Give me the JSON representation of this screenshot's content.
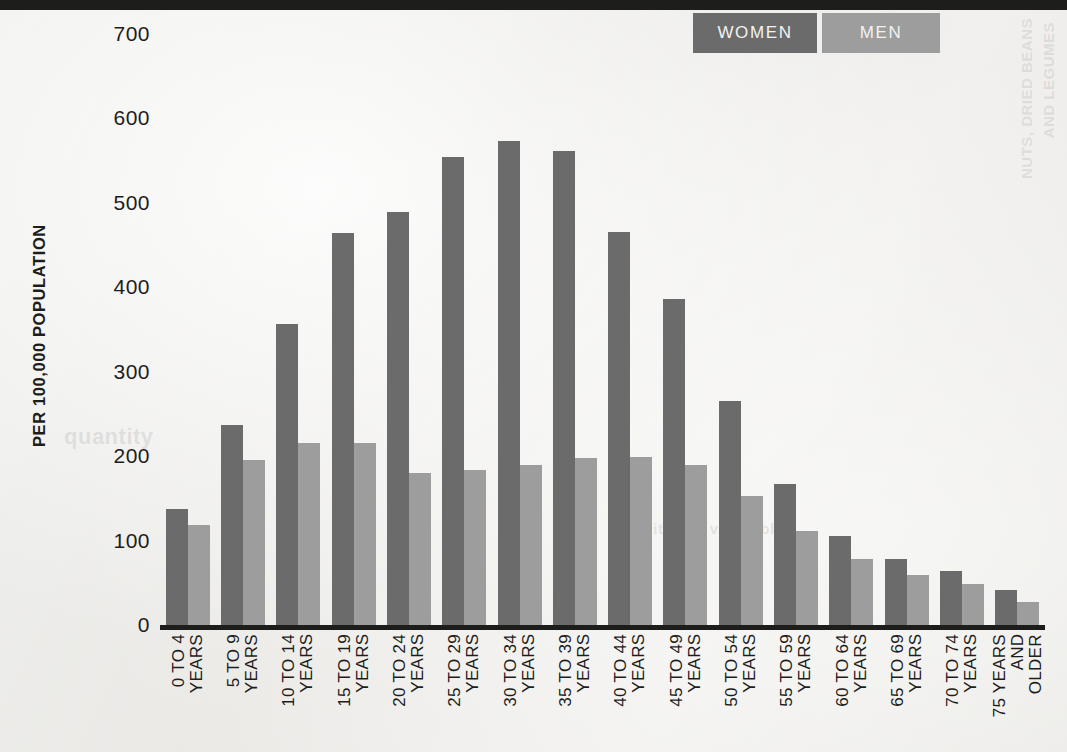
{
  "legend": {
    "items": [
      {
        "label": "WOMEN",
        "color": "#6b6b6b",
        "key": "women"
      },
      {
        "label": "MEN",
        "color": "#9d9d9d",
        "key": "men"
      }
    ]
  },
  "axis": {
    "y_title": "PER 100,000 POPULATION"
  },
  "ghost_text": {
    "right_1": "AND LEGUMES",
    "right_2": "NUTS, DRIED BEANS",
    "left_1": "quantity",
    "left_2": "of fruits and vegetables"
  },
  "chart_data": {
    "type": "bar",
    "title": "",
    "subtitle": "",
    "xlabel": "",
    "ylabel": "PER 100,000 POPULATION",
    "ylim": [
      0,
      700
    ],
    "yticks": [
      0,
      100,
      200,
      300,
      400,
      500,
      600,
      700
    ],
    "ytick_labels": [
      "0",
      "100",
      "200",
      "300",
      "400",
      "500",
      "600",
      "700"
    ],
    "grid": false,
    "legend_position": "top-right",
    "categories": [
      "0 TO 4\nYEARS",
      "5 TO 9\nYEARS",
      "10 TO 14\nYEARS",
      "15 TO 19\nYEARS",
      "20 TO 24\nYEARS",
      "25 TO 29\nYEARS",
      "30 TO 34\nYEARS",
      "35 TO 39\nYEARS",
      "40 TO 44\nYEARS",
      "45 TO 49\nYEARS",
      "50 TO 54\nYEARS",
      "55 TO 59\nYEARS",
      "60 TO 64\nYEARS",
      "65 TO 69\nYEARS",
      "70 TO 74\nYEARS",
      "75 YEARS\nAND\nOLDER"
    ],
    "series": [
      {
        "name": "WOMEN",
        "color": "#6b6b6b",
        "values": [
          138,
          237,
          356,
          464,
          489,
          554,
          573,
          562,
          466,
          386,
          265,
          167,
          105,
          78,
          64,
          41
        ]
      },
      {
        "name": "MEN",
        "color": "#9d9d9d",
        "values": [
          118,
          196,
          215,
          215,
          180,
          184,
          189,
          198,
          199,
          190,
          153,
          111,
          78,
          59,
          48,
          27
        ]
      }
    ]
  }
}
